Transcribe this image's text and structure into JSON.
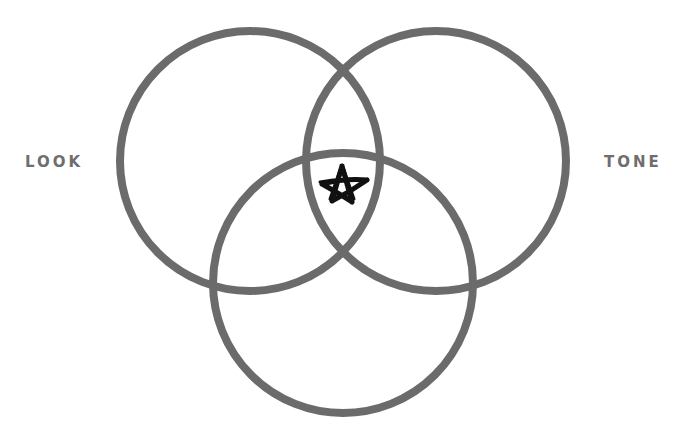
{
  "diagram": {
    "type": "venn",
    "stroke_color": "#6b6b6b",
    "stroke_width": 8,
    "marker_color": "#111111",
    "labels": {
      "left": "LOOK",
      "right": "TONE"
    },
    "circles": [
      {
        "name": "left",
        "cx": 250,
        "cy": 161,
        "r": 130
      },
      {
        "name": "right",
        "cx": 436,
        "cy": 161,
        "r": 130
      },
      {
        "name": "bottom",
        "cx": 343,
        "cy": 283,
        "r": 130
      }
    ],
    "center_marker": "star-doodle"
  }
}
